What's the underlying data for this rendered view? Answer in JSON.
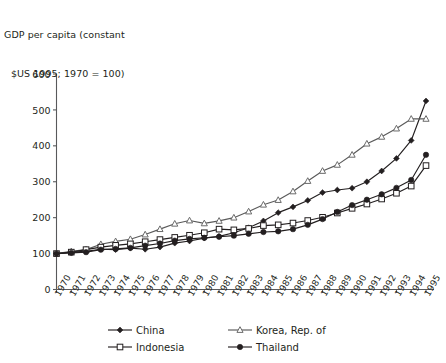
{
  "chart_data": {
    "type": "line",
    "title": "GDP per capita (constant $US 1995; 1970 = 100)",
    "title_lines": [
      "GDP per capita (constant",
      "$US 1995; 1970 = 100)"
    ],
    "xlabel": "",
    "ylabel": "",
    "ylim": [
      0,
      600
    ],
    "ytick_values": [
      0,
      100,
      200,
      300,
      400,
      500,
      600
    ],
    "ytick_labels": [
      "0",
      "100",
      "200",
      "300",
      "400",
      "500",
      "600"
    ],
    "grid": false,
    "legend_position": "bottom",
    "x": [
      1970,
      1971,
      1972,
      1973,
      1974,
      1975,
      1976,
      1977,
      1978,
      1979,
      1980,
      1981,
      1982,
      1983,
      1984,
      1985,
      1986,
      1987,
      1988,
      1989,
      1990,
      1991,
      1992,
      1993,
      1994,
      1995
    ],
    "xtick_labels": [
      "1970",
      "1971",
      "1972",
      "1973",
      "1974",
      "1975",
      "1976",
      "1977",
      "1978",
      "1979",
      "1980",
      "1981",
      "1982",
      "1983",
      "1984",
      "1985",
      "1986",
      "1987",
      "1988",
      "1989",
      "1990",
      "1991",
      "1992",
      "1993",
      "1994",
      "1995"
    ],
    "series": [
      {
        "name": "China",
        "marker": "filled-diamond",
        "color": "#231f20",
        "values": [
          100,
          104,
          106,
          112,
          111,
          115,
          112,
          118,
          129,
          135,
          143,
          148,
          158,
          172,
          191,
          214,
          230,
          248,
          270,
          277,
          282,
          300,
          330,
          365,
          415,
          525
        ]
      },
      {
        "name": "Korea, Rep. of",
        "marker": "open-triangle",
        "color": "#5a5a5a",
        "values": [
          100,
          106,
          111,
          126,
          134,
          140,
          153,
          168,
          183,
          192,
          184,
          191,
          200,
          217,
          236,
          249,
          273,
          302,
          330,
          347,
          375,
          406,
          425,
          448,
          475,
          475
        ]
      },
      {
        "name": "Indonesia",
        "marker": "open-square",
        "color": "#231f20",
        "values": [
          100,
          104,
          111,
          118,
          123,
          127,
          133,
          139,
          145,
          151,
          158,
          168,
          166,
          170,
          178,
          180,
          185,
          192,
          201,
          213,
          226,
          238,
          252,
          268,
          288,
          345
        ]
      },
      {
        "name": "Thailand",
        "marker": "filled-circle",
        "color": "#231f20",
        "values": [
          100,
          102,
          104,
          111,
          113,
          116,
          122,
          128,
          136,
          141,
          144,
          147,
          150,
          155,
          160,
          162,
          168,
          180,
          196,
          216,
          235,
          250,
          265,
          283,
          305,
          375
        ]
      }
    ]
  },
  "legend": {
    "entries": [
      {
        "label": "China",
        "marker": "filled-diamond"
      },
      {
        "label": "Korea, Rep. of",
        "marker": "open-triangle"
      },
      {
        "label": "Indonesia",
        "marker": "open-square"
      },
      {
        "label": "Thailand",
        "marker": "filled-circle"
      }
    ]
  },
  "colors": {
    "line": "#231f20",
    "korea": "#5a5a5a",
    "axis": "#58595b",
    "text": "#231f20"
  }
}
